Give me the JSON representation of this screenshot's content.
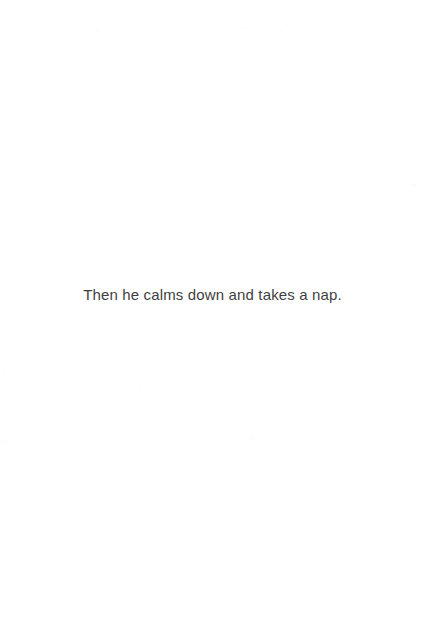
{
  "page": {
    "kind": "scanned-book-page",
    "width": 425,
    "height": 621,
    "background_color": "#ffffff",
    "text_color": "#3f3f3f"
  },
  "content": {
    "body_text": "Then he calms down and takes a nap."
  }
}
